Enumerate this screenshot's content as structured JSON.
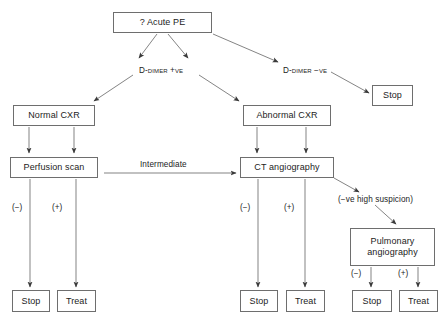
{
  "diagram": {
    "background_color": "#ffffff",
    "line_color": "#6e6e6e",
    "text_color": "#1c1c1c"
  },
  "nodes": [
    {
      "id": "acute-pe",
      "label": "? Acute PE",
      "x": 113,
      "y": 12,
      "w": 99,
      "h": 21
    },
    {
      "id": "stop-top",
      "label": "Stop",
      "x": 372,
      "y": 85,
      "w": 41,
      "h": 21
    },
    {
      "id": "normal-cxr",
      "label": "Normal CXR",
      "x": 13,
      "y": 105,
      "w": 82,
      "h": 21
    },
    {
      "id": "abnormal-cxr",
      "label": "Abnormal CXR",
      "x": 243,
      "y": 105,
      "w": 88,
      "h": 21
    },
    {
      "id": "perfusion",
      "label": "Perfusion scan",
      "x": 10,
      "y": 157,
      "w": 88,
      "h": 21
    },
    {
      "id": "ct-angio",
      "label": "CT angiography",
      "x": 240,
      "y": 157,
      "w": 94,
      "h": 21
    },
    {
      "id": "pulm-angio",
      "label": "Pulmonary\nangiography",
      "x": 350,
      "y": 228,
      "w": 85,
      "h": 38
    },
    {
      "id": "stop-left",
      "label": "Stop",
      "x": 12,
      "y": 290,
      "w": 38,
      "h": 22
    },
    {
      "id": "treat-left",
      "label": "Treat",
      "x": 57,
      "y": 290,
      "w": 39,
      "h": 22
    },
    {
      "id": "stop-mid",
      "label": "Stop",
      "x": 240,
      "y": 290,
      "w": 38,
      "h": 22
    },
    {
      "id": "treat-mid",
      "label": "Treat",
      "x": 286,
      "y": 290,
      "w": 39,
      "h": 22
    },
    {
      "id": "stop-right",
      "label": "Stop",
      "x": 352,
      "y": 290,
      "w": 40,
      "h": 22
    },
    {
      "id": "treat-right",
      "label": "Treat",
      "x": 399,
      "y": 290,
      "w": 39,
      "h": 22
    }
  ],
  "edge_labels": [
    {
      "id": "d-dimer-pos",
      "text": "D-dimer +ve",
      "x": 139,
      "y": 66,
      "smallcaps": true
    },
    {
      "id": "d-dimer-neg",
      "text": "D-dimer −ve",
      "x": 283,
      "y": 66,
      "smallcaps": true
    },
    {
      "id": "intermediate",
      "text": "Intermediate",
      "x": 140,
      "y": 160,
      "smallcaps": false
    },
    {
      "id": "neg-high-suspicion",
      "text": "(−ve high suspicion)",
      "x": 338,
      "y": 195,
      "smallcaps": false
    }
  ],
  "sign_labels": [
    {
      "id": "perfusion-neg",
      "text": "(−)",
      "x": 12,
      "y": 203
    },
    {
      "id": "perfusion-pos",
      "text": "(+)",
      "x": 52,
      "y": 203
    },
    {
      "id": "ct-neg",
      "text": "(−)",
      "x": 240,
      "y": 203
    },
    {
      "id": "ct-pos",
      "text": "(+)",
      "x": 284,
      "y": 203
    },
    {
      "id": "pulm-neg",
      "text": "(−)",
      "x": 351,
      "y": 269
    },
    {
      "id": "pulm-pos",
      "text": "(+)",
      "x": 398,
      "y": 269
    }
  ],
  "edges": [
    {
      "id": "acutepe-to-ddimerpos-left",
      "from": "acute-pe",
      "to": "d-dimer-pos"
    },
    {
      "id": "acutepe-to-ddimerpos-right",
      "from": "acute-pe",
      "to": "d-dimer-pos"
    },
    {
      "id": "acutepe-to-ddimerneg",
      "from": "acute-pe",
      "to": "d-dimer-neg"
    },
    {
      "id": "ddimerneg-to-stop",
      "from": "d-dimer-neg",
      "to": "stop-top"
    },
    {
      "id": "ddimerpos-to-normalcxr",
      "from": "d-dimer-pos",
      "to": "normal-cxr"
    },
    {
      "id": "ddimerpos-to-abnormalcxr",
      "from": "d-dimer-pos",
      "to": "abnormal-cxr"
    },
    {
      "id": "normalcxr-to-perfusion-a",
      "from": "normal-cxr",
      "to": "perfusion"
    },
    {
      "id": "normalcxr-to-perfusion-b",
      "from": "normal-cxr",
      "to": "perfusion"
    },
    {
      "id": "abnormalcxr-to-ctangio-a",
      "from": "abnormal-cxr",
      "to": "ct-angio"
    },
    {
      "id": "abnormalcxr-to-ctangio-b",
      "from": "abnormal-cxr",
      "to": "ct-angio"
    },
    {
      "id": "perfusion-to-ctangio",
      "from": "perfusion",
      "to": "ct-angio",
      "label": "Intermediate"
    },
    {
      "id": "perfusion-to-stop",
      "from": "perfusion",
      "to": "stop-left",
      "label": "(−)"
    },
    {
      "id": "perfusion-to-treat",
      "from": "perfusion",
      "to": "treat-left",
      "label": "(+)"
    },
    {
      "id": "ctangio-to-stop",
      "from": "ct-angio",
      "to": "stop-mid",
      "label": "(−)"
    },
    {
      "id": "ctangio-to-treat",
      "from": "ct-angio",
      "to": "treat-mid",
      "label": "(+)"
    },
    {
      "id": "ctangio-to-pulmangio",
      "from": "ct-angio",
      "to": "pulm-angio",
      "label": "(−ve high suspicion)"
    },
    {
      "id": "pulmangio-to-stop",
      "from": "pulm-angio",
      "to": "stop-right",
      "label": "(−)"
    },
    {
      "id": "pulmangio-to-treat",
      "from": "pulm-angio",
      "to": "treat-right",
      "label": "(+)"
    }
  ]
}
